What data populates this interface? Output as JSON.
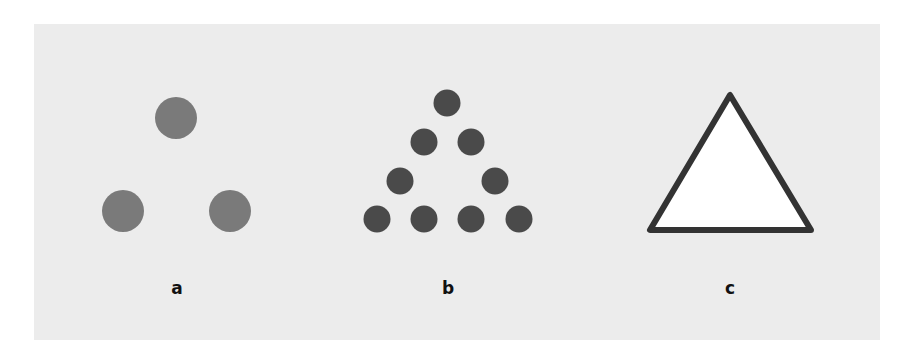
{
  "figure": {
    "background_color": "#ececec",
    "panels": [
      {
        "id": "a",
        "label": "a",
        "description": "Three separate gray circles arranged at the vertices of a triangle",
        "circle_color": "#7a7a7a",
        "circles": [
          {
            "cx": 176,
            "cy": 118,
            "r": 21
          },
          {
            "cx": 123,
            "cy": 211,
            "r": 21
          },
          {
            "cx": 230,
            "cy": 211,
            "r": 21
          }
        ],
        "label_x": 177
      },
      {
        "id": "b",
        "label": "b",
        "description": "Nine dark dots forming the outline of a triangle",
        "circle_color": "#4a4a4a",
        "circles": [
          {
            "cx": 447,
            "cy": 103,
            "r": 13.5
          },
          {
            "cx": 424,
            "cy": 142,
            "r": 13.5
          },
          {
            "cx": 471,
            "cy": 142,
            "r": 13.5
          },
          {
            "cx": 400,
            "cy": 181,
            "r": 13.5
          },
          {
            "cx": 495,
            "cy": 181,
            "r": 13.5
          },
          {
            "cx": 377,
            "cy": 219,
            "r": 13.5
          },
          {
            "cx": 424,
            "cy": 219,
            "r": 13.5
          },
          {
            "cx": 471,
            "cy": 219,
            "r": 13.5
          },
          {
            "cx": 519,
            "cy": 219,
            "r": 13.5
          }
        ],
        "label_x": 448
      },
      {
        "id": "c",
        "label": "c",
        "description": "White triangle with thick dark outline",
        "fill": "#ffffff",
        "stroke": "#333333",
        "stroke_width": 6,
        "points": [
          [
            730,
            95
          ],
          [
            650,
            230
          ],
          [
            811,
            230
          ]
        ],
        "label_x": 730
      }
    ]
  }
}
